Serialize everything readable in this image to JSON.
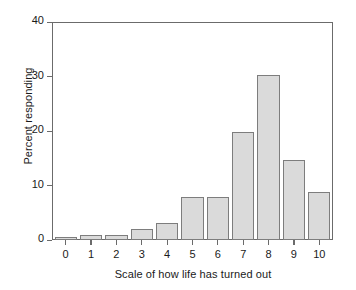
{
  "chart_data": {
    "type": "bar",
    "title": "",
    "subtitle": "",
    "xlabel": "Scale of how life has turned out",
    "ylabel": "Percent responding",
    "categories": [
      "0",
      "1",
      "2",
      "3",
      "4",
      "5",
      "6",
      "7",
      "8",
      "9",
      "10"
    ],
    "values": [
      0.5,
      1.0,
      1.0,
      2.0,
      3.2,
      8.0,
      8.0,
      20.0,
      30.5,
      14.7,
      8.8
    ],
    "ylim": [
      0,
      40
    ],
    "yticks": [
      0,
      10,
      20,
      30,
      40
    ],
    "ytick_labels": [
      "0",
      "10",
      "20",
      "30",
      "40"
    ],
    "xtick_labels": [
      "0",
      "1",
      "2",
      "3",
      "4",
      "5",
      "6",
      "7",
      "8",
      "9",
      "10"
    ],
    "grid": false,
    "legend": null,
    "legend_position": "none",
    "annotations": [],
    "colors": {
      "bar_fill": "#dadada",
      "bar_border": "#7d7d7d",
      "axis": "#6b6b6b",
      "text": "#1a1a1a",
      "background": "#ffffff"
    }
  }
}
